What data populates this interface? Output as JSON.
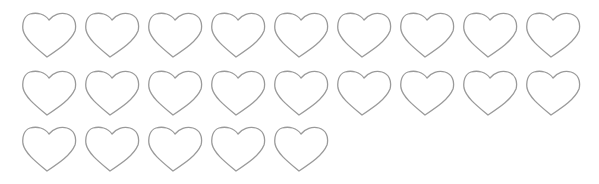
{
  "hearts": {
    "count": 23,
    "stroke_color": "#9a9a9a",
    "fill_color": "#ffffff",
    "rows": [
      9,
      9,
      5
    ],
    "origin_x": 21,
    "spacing_x": 63,
    "row_y": [
      11,
      69,
      125
    ]
  }
}
